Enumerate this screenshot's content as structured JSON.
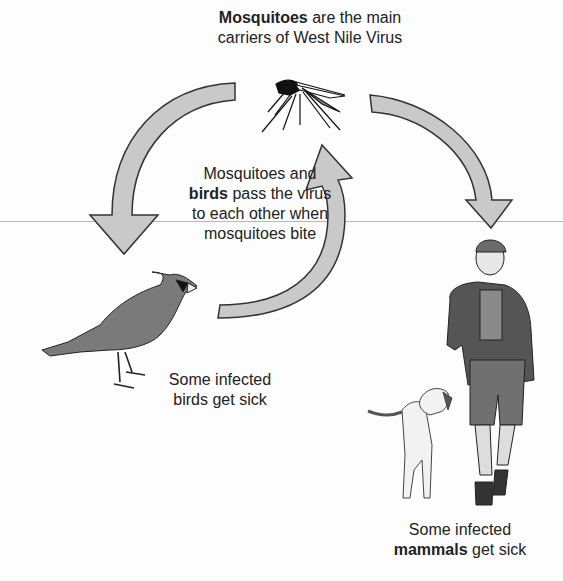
{
  "title": {
    "bold": "Mosquitoes",
    "line1_rest": " are the main",
    "line2": "carriers of West Nile Virus"
  },
  "center_text": {
    "line1": "Mosquitoes and",
    "line2_bold": "birds",
    "line2_rest": " pass the virus",
    "line3": "to each other when",
    "line4": "mosquitoes bite"
  },
  "birds_caption": {
    "line1": "Some infected",
    "line2": "birds get sick"
  },
  "mammals_caption": {
    "line1": "Some infected",
    "line2_bold": "mammals",
    "line2_rest": " get sick"
  },
  "illustrations": [
    "mosquito",
    "bird-cardinal",
    "man-hiker",
    "dog"
  ],
  "arrows": [
    {
      "from": "mosquito",
      "to": "bird",
      "direction": "counterclockwise-down-left"
    },
    {
      "from": "bird",
      "to": "mosquito",
      "direction": "up"
    },
    {
      "from": "mosquito",
      "to": "mammals",
      "direction": "clockwise-down-right"
    }
  ],
  "colors": {
    "arrow_fill": "#c9c9c9",
    "arrow_stroke": "#333333",
    "figure_fill": "#7a7a7a",
    "text": "#222222"
  }
}
